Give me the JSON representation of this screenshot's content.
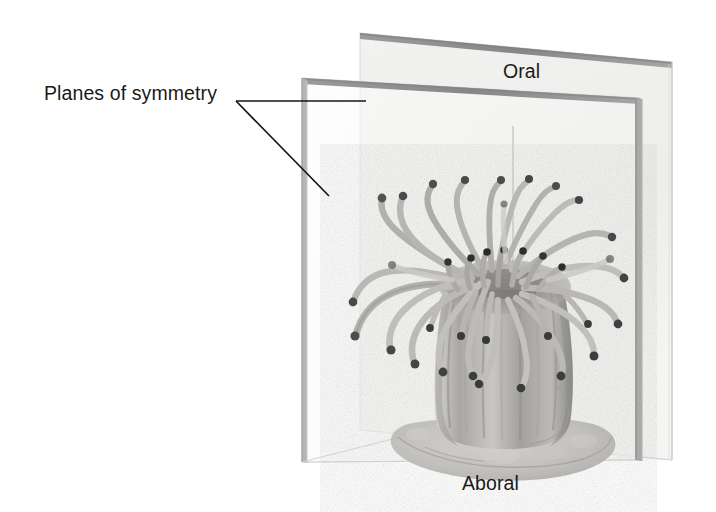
{
  "figure": {
    "kind": "biology-textbook-illustration",
    "background_color": "#ffffff"
  },
  "labels": {
    "planes_of_symmetry": "Planes of symmetry",
    "oral": "Oral",
    "aboral": "Aboral"
  },
  "colors": {
    "text": "#1a1a1a",
    "leader_line": "#141414",
    "plane_edge_dark": "#8c8c8c",
    "plane_edge_light": "#b9b9b9",
    "plane_fill_back": "#eeeeec",
    "plane_fill_front": "#f7f7f6",
    "animal_body": "#b7b5b2",
    "animal_shadow": "#8a8885",
    "tentacle_tip": "#4a4a4a",
    "pedal_disc": "#c6c4c1"
  },
  "geometry": {
    "leader_origin": [
      236,
      101
    ],
    "leader_horizontal_end": [
      366,
      101
    ],
    "leader_diagonal_end": [
      329,
      196
    ],
    "back_plane_corners": [
      [
        360,
        33
      ],
      [
        672,
        62
      ],
      [
        672,
        460
      ],
      [
        360,
        430
      ]
    ],
    "front_plane_corners": [
      [
        302,
        78
      ],
      [
        302,
        462
      ],
      [
        640,
        460
      ],
      [
        640,
        98
      ]
    ],
    "intersection_top": [
      513,
      126
    ],
    "intersection_bottom": [
      513,
      455
    ]
  }
}
